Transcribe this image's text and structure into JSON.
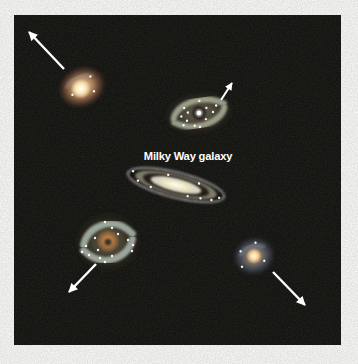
{
  "figure": {
    "background": "#ffffff",
    "panel": {
      "x": 14,
      "y": 15,
      "width": 327,
      "height": 330,
      "color": "#0c0c0a"
    }
  },
  "label": {
    "text": "Milky Way galaxy",
    "x": 188,
    "y": 160,
    "color": "#ffffff"
  },
  "arrow_color": "#ffffff",
  "galaxies": [
    {
      "name": "galaxy-top-left",
      "kind": "glow",
      "cx": 82,
      "cy": 87,
      "rx": 24,
      "ry": 20,
      "rotate": -25,
      "halo": [
        "#ffe9c8",
        "#b98a5e",
        "#6a4734"
      ],
      "core": {
        "colors": [
          "#ffffff",
          "#ffedbb"
        ],
        "r": 10,
        "dx": -2,
        "dy": 1
      },
      "arc": "rgba(190,205,220,0.22)",
      "stars": [
        [
          -12,
          3
        ],
        [
          12,
          -6
        ],
        [
          9,
          9
        ]
      ]
    },
    {
      "name": "galaxy-top-middle",
      "kind": "spiral",
      "cx": 199,
      "cy": 113,
      "rx": 36,
      "ry": 22,
      "rotate": -8,
      "halo": [
        "#6b6452",
        "#4e483a",
        "#2a261e"
      ],
      "arms": {
        "color": "#a9ae97",
        "width": 6
      },
      "center": {
        "disk": "#27241d",
        "disk_r": 7,
        "dot": "#ffffff",
        "dot_r": 2.2
      },
      "stars": [
        [
          -14,
          -7
        ],
        [
          -18,
          1
        ],
        [
          -11,
          -2
        ],
        [
          -13,
          6
        ],
        [
          8,
          -4
        ],
        [
          14,
          1
        ],
        [
          18,
          -5
        ],
        [
          6,
          7
        ],
        [
          -6,
          12
        ],
        [
          -1,
          14
        ],
        [
          2,
          -12
        ],
        [
          -17,
          10
        ]
      ]
    },
    {
      "name": "galaxy-milky-way",
      "kind": "edgeon",
      "cx": 176,
      "cy": 185,
      "rotate": 14,
      "rings": [
        {
          "rx": 50,
          "ry": 13,
          "fill": "#15130e",
          "stroke": "rgba(255,255,255,0.9)"
        },
        {
          "rx": 42,
          "ry": 10.5,
          "fill": "#7e7a6b"
        },
        {
          "rx": 34,
          "ry": 8.4,
          "fill": "#211f18"
        },
        {
          "rx": 26,
          "ry": 6.5,
          "fill": "#d8d4c2"
        }
      ],
      "core": {
        "colors": [
          "#ffffff",
          "#f2eac2",
          "#d8d4c2"
        ],
        "rx": 19,
        "ry": 4.8
      },
      "stars": [
        [
          -45,
          -3
        ],
        [
          -38,
          5
        ],
        [
          -24,
          8
        ],
        [
          14,
          8
        ],
        [
          27,
          7
        ],
        [
          38,
          6
        ],
        [
          45,
          2
        ],
        [
          22,
          -7
        ],
        [
          -10,
          -8
        ]
      ]
    },
    {
      "name": "galaxy-bottom-left",
      "kind": "spiral",
      "cx": 108,
      "cy": 242,
      "rx": 34,
      "ry": 31,
      "rotate": 0,
      "halo": [
        "#5c5745",
        "#464233",
        "#27241c"
      ],
      "arms": {
        "color": "#aab6aa",
        "width": 7
      },
      "core": {
        "colors": [
          "#eaa964",
          "#b4763f"
        ],
        "r": 12,
        "dx": 0,
        "dy": -1
      },
      "center": {
        "disk": "#3a3026",
        "disk_r": 3.5,
        "dot": "",
        "dot_r": 0
      },
      "stars": [
        [
          -3,
          -20
        ],
        [
          4,
          -14
        ],
        [
          -22,
          4
        ],
        [
          -26,
          10
        ],
        [
          -19,
          13
        ],
        [
          -8,
          16
        ],
        [
          -3,
          20
        ],
        [
          4,
          14
        ],
        [
          20,
          -2
        ],
        [
          25,
          3
        ],
        [
          24,
          9
        ],
        [
          -13,
          -4
        ],
        [
          -10,
          8
        ],
        [
          10,
          -8
        ]
      ]
    },
    {
      "name": "galaxy-bottom-right",
      "kind": "glow",
      "cx": 254,
      "cy": 256,
      "rx": 21,
      "ry": 19,
      "rotate": -20,
      "halo": [
        "#cfa06a",
        "#6e6a68",
        "#3e4450"
      ],
      "core": {
        "colors": [
          "#ffffff",
          "#ffd89a"
        ],
        "r": 8,
        "dx": 0,
        "dy": 0
      },
      "arc": "rgba(150,170,200,0.3)",
      "stars": [
        [
          -11,
          -9
        ],
        [
          6,
          -12
        ],
        [
          8,
          8
        ],
        [
          -15,
          6
        ]
      ]
    }
  ],
  "arrows": [
    {
      "name": "recession-arrow-top-left",
      "x1": 64,
      "y1": 69,
      "x2": 29,
      "y2": 32,
      "width": 2.4
    },
    {
      "name": "recession-arrow-top-middle",
      "x1": 221,
      "y1": 100,
      "x2": 232,
      "y2": 83,
      "width": 2.0
    },
    {
      "name": "recession-arrow-bottom-left",
      "x1": 96,
      "y1": 264,
      "x2": 69,
      "y2": 292,
      "width": 2.4
    },
    {
      "name": "recession-arrow-bottom-right",
      "x1": 273,
      "y1": 272,
      "x2": 305,
      "y2": 305,
      "width": 2.4
    }
  ]
}
